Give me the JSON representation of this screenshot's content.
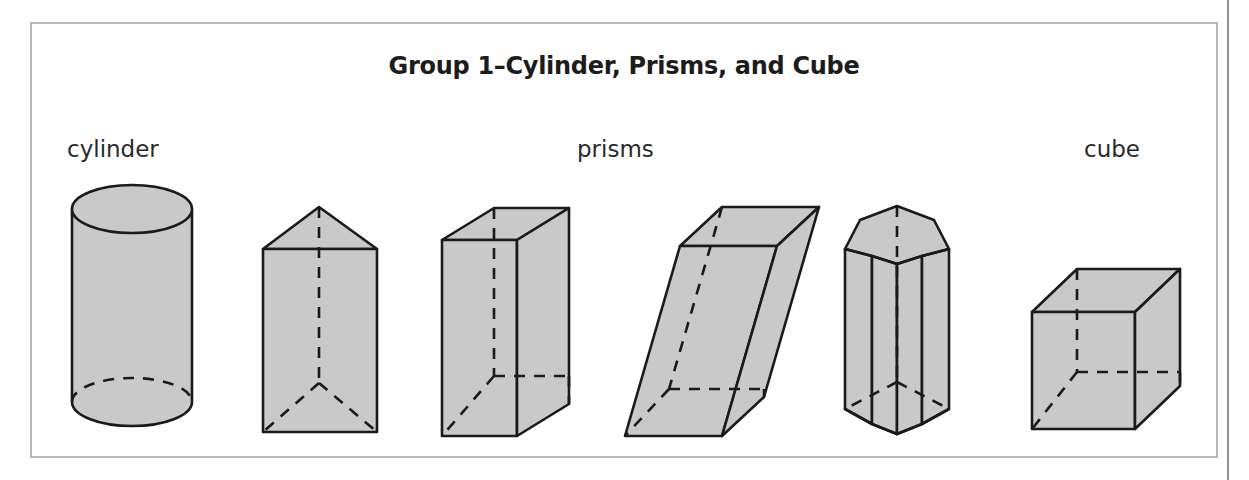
{
  "figure": {
    "title": "Group 1–Cylinder, Prisms, and Cube",
    "frame_border_color": "#b9b9b9",
    "page_background": "#ffffff"
  },
  "labels": {
    "cylinder": "cylinder",
    "prisms": "prisms",
    "cube": "cube"
  },
  "style": {
    "solid_fill": "#c9c9c9",
    "edge_color": "#1a1a1a",
    "hidden_edge_style": "dashed",
    "text_color": "#1c1c1c"
  },
  "shapes": [
    {
      "name": "cylinder",
      "category": "cylinder",
      "description": "Right circular cylinder with elliptical top face and dashed hidden back arc of the base"
    },
    {
      "name": "triangular-prism",
      "category": "prisms",
      "description": "Triangular prism standing upright with dashed hidden vertical edge and hidden base edges"
    },
    {
      "name": "rectangular-prism",
      "category": "prisms",
      "description": "Rectangular prism (cuboid) in oblique view with dashed hidden back edges"
    },
    {
      "name": "oblique-prism",
      "category": "prisms",
      "description": "Oblique rectangular prism slanted to the right with dashed hidden edges"
    },
    {
      "name": "pentagonal-prism",
      "category": "prisms",
      "description": "Pentagonal prism standing upright with dashed hidden vertical edge and base edges"
    },
    {
      "name": "cube",
      "category": "cube",
      "description": "Cube in oblique view with dashed hidden back edges"
    }
  ]
}
